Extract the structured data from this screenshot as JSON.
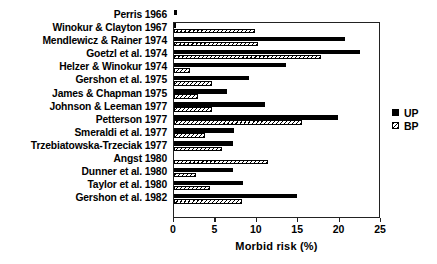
{
  "chart_data": {
    "type": "bar",
    "orientation": "horizontal",
    "title": "",
    "xlabel": "Morbid risk (%)",
    "ylabel": "",
    "xlim": [
      0,
      25
    ],
    "xticks": [
      0,
      5,
      10,
      15,
      20,
      25
    ],
    "xtick_labels": [
      "0",
      "5",
      "10",
      "15",
      "20",
      "25"
    ],
    "grid": false,
    "legend_position": "right",
    "legend": [
      "UP",
      "BP"
    ],
    "categories": [
      "Perris 1966",
      "Winokur & Clayton 1967",
      "Mendlewicz & Rainer 1974",
      "Goetzl et al. 1974",
      "Helzer & Winokur 1974",
      "Gershon et al. 1975",
      "James & Chapman 1975",
      "Johnson & Leeman 1977",
      "Petterson 1977",
      "Smeraldi et al. 1977",
      "Trzebiatowska-Trzeciak 1977",
      "Angst 1980",
      "Dunner et al. 1980",
      "Taylor et al. 1980",
      "Gershon et al. 1982"
    ],
    "series": [
      {
        "name": "UP",
        "color": "#000000",
        "fill": "solid",
        "values": [
          0.4,
          0.2,
          20.6,
          22.5,
          13.5,
          9.1,
          6.4,
          11.0,
          19.8,
          7.3,
          7.1,
          0.0,
          7.1,
          8.3,
          14.9
        ]
      },
      {
        "name": "BP",
        "color": "#000000",
        "fill": "hatched",
        "values": [
          0.0,
          9.8,
          10.1,
          17.7,
          1.9,
          4.6,
          2.9,
          4.6,
          15.4,
          3.7,
          5.8,
          11.4,
          2.6,
          4.3,
          8.2
        ]
      }
    ]
  },
  "legend": {
    "items": [
      {
        "label": "UP",
        "swatch": "solid-black-square-icon"
      },
      {
        "label": "BP",
        "swatch": "hatched-square-icon"
      }
    ]
  },
  "axis": {
    "x_title": "Morbid risk (%)"
  }
}
